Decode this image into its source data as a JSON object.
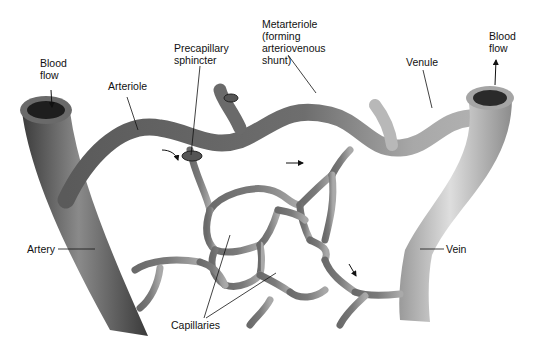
{
  "diagram": {
    "labels": {
      "blood_flow_in": "Blood\nflow",
      "arteriole": "Arteriole",
      "precapillary_sphincter": "Precapillary\nsphincter",
      "metarteriole": "Metarteriole\n(forming\narteriovenous\nshunt)",
      "venule": "Venule",
      "blood_flow_out": "Blood\nflow",
      "artery": "Artery",
      "vein": "Vein",
      "capillaries": "Capillaries"
    },
    "colors": {
      "vessel_dark": "#4a4a4a",
      "vessel_mid": "#7d7d7d",
      "vessel_light": "#bdbdbd",
      "lumen": "#1e1e1e",
      "label_text": "#111111",
      "background": "#ffffff"
    }
  }
}
